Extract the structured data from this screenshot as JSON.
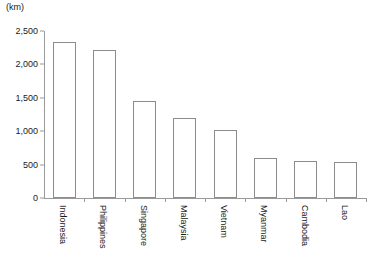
{
  "chart_data": {
    "type": "bar",
    "title": "",
    "subtitle": "",
    "unit_label": "(km)",
    "xlabel": "",
    "ylabel": "",
    "ylim": [
      0,
      2500
    ],
    "ytick_values": [
      0,
      500,
      1000,
      1500,
      2000,
      2500
    ],
    "ytick_labels": [
      "0",
      "500",
      "1,000",
      "1,500",
      "2,000",
      "2,500"
    ],
    "grid": false,
    "legend": null,
    "categories": [
      "Indonesia",
      "Philippines",
      "Singapore",
      "Malaysia",
      "Vietnam",
      "Myanmar",
      "Cambodia",
      "Lao"
    ],
    "values": [
      2340,
      2210,
      1450,
      1200,
      1020,
      600,
      560,
      540
    ],
    "bar_fill_color": "#ffffff",
    "bar_border_color": "#8c8c8c",
    "axis_color": "#9a9a9a",
    "text_color": "#1a1a1a"
  }
}
